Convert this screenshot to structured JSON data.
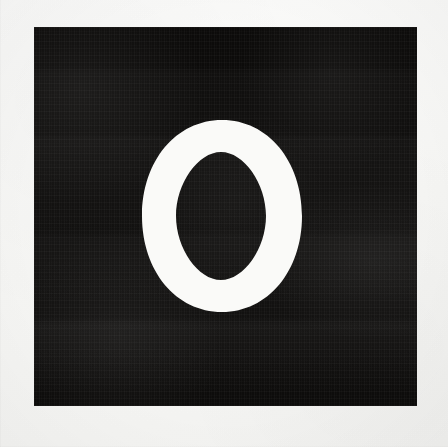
{
  "image": {
    "kind": "letter-specimen",
    "description": "Scanned white capital letter O on a black square plate over off-white paper",
    "width": 448,
    "height": 447,
    "alt_text": "Capital letter O"
  },
  "background": {
    "name": "paper",
    "color": "#f7f7f6",
    "texture": "paper-grain"
  },
  "plate": {
    "name": "black-square",
    "color": "#0c0b0a",
    "left": 34,
    "top": 27,
    "width": 383,
    "height": 379,
    "texture": "photographic-noise-and-banding"
  },
  "glyph": {
    "character": "O",
    "name": "letter-o",
    "style": "serif",
    "color": "#fafaf8",
    "outer": {
      "left": 142,
      "top": 120,
      "width": 160,
      "height": 192
    },
    "counter": {
      "left": 176,
      "top": 152,
      "width": 90,
      "height": 128
    },
    "stroke_side_px": 32,
    "stroke_top_px": 32,
    "stress": "vertical"
  }
}
